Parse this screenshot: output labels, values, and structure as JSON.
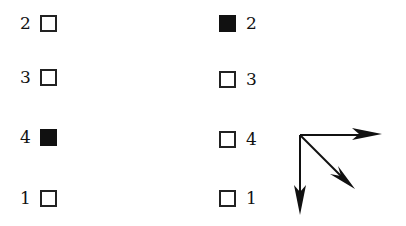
{
  "left_column": [
    {
      "label": "2",
      "filled": false
    },
    {
      "label": "3",
      "filled": false
    },
    {
      "label": "4",
      "filled": true
    },
    {
      "label": "1",
      "filled": false
    }
  ],
  "right_column": [
    {
      "label": "2",
      "filled": true
    },
    {
      "label": "3",
      "filled": false
    },
    {
      "label": "4",
      "filled": false
    },
    {
      "label": "1",
      "filled": false
    }
  ],
  "arrows": [
    "arrow-right",
    "arrow-down-right",
    "arrow-down"
  ],
  "colors": {
    "ink": "#111111",
    "background": "#ffffff"
  }
}
